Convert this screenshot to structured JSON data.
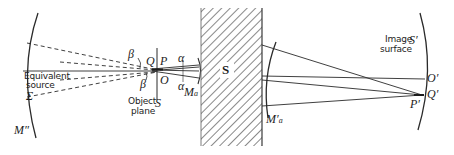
{
  "diagram": {
    "type": "optical ray diagram",
    "colors": {
      "ink": "#2a2a2a",
      "hatch": "#6a6a6a",
      "background": "#ffffff"
    },
    "labels": {
      "equivalent_source": [
        "Equivalent",
        "source"
      ],
      "sigma": "Σ",
      "m_double_prime": "M″",
      "beta_top": "β",
      "beta_bottom": "β",
      "q": "Q",
      "p": "P",
      "o": "O",
      "object_plane": [
        "Object",
        "plane"
      ],
      "s_plane": "S",
      "alpha_top": "α",
      "alpha_bottom": "α",
      "m_a": "M",
      "m_a_sub": "a",
      "system": "S",
      "m_a_prime": "M′",
      "m_a_prime_sub": "a",
      "image_surface": [
        "Image",
        "surface"
      ],
      "s_prime": "S′",
      "o_prime": "O′",
      "q_prime": "Q′",
      "p_prime": "P′"
    }
  }
}
